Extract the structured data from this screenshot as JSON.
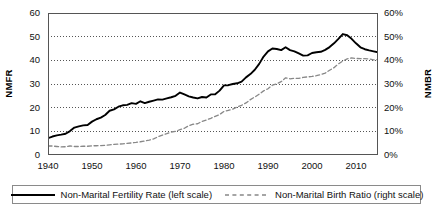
{
  "chart_data": {
    "type": "line",
    "title": "",
    "xlabel": "",
    "ylabel": "NMFR",
    "y2label": "NMBR",
    "xlim": [
      1940,
      2015
    ],
    "ylim": [
      0,
      60
    ],
    "y2lim": [
      0,
      60
    ],
    "grid": true,
    "legend_position": "bottom",
    "x_ticks": [
      "1940",
      "1950",
      "1960",
      "1970",
      "1980",
      "1990",
      "2000",
      "2010"
    ],
    "y_ticks_left": [
      "0",
      "10",
      "20",
      "30",
      "40",
      "50",
      "60"
    ],
    "y_ticks_right": [
      "0%",
      "10%",
      "20%",
      "30%",
      "40%",
      "50%",
      "60%"
    ],
    "series": [
      {
        "name": "Non-Marital Fertility Rate (left scale)",
        "axis": "left",
        "style": "solid",
        "color": "#000000",
        "x": [
          1940,
          1941,
          1942,
          1943,
          1944,
          1945,
          1946,
          1947,
          1948,
          1949,
          1950,
          1951,
          1952,
          1953,
          1954,
          1955,
          1956,
          1957,
          1958,
          1959,
          1960,
          1961,
          1962,
          1963,
          1964,
          1965,
          1966,
          1967,
          1968,
          1969,
          1970,
          1971,
          1972,
          1973,
          1974,
          1975,
          1976,
          1977,
          1978,
          1979,
          1980,
          1981,
          1982,
          1983,
          1984,
          1985,
          1986,
          1987,
          1988,
          1989,
          1990,
          1991,
          1992,
          1993,
          1994,
          1995,
          1996,
          1997,
          1998,
          1999,
          2000,
          2001,
          2002,
          2003,
          2004,
          2005,
          2006,
          2007,
          2008,
          2009,
          2010,
          2011,
          2012,
          2013,
          2014,
          2015
        ],
        "values": [
          7.1,
          7.8,
          8.3,
          8.6,
          9.0,
          10.1,
          11.6,
          12.1,
          12.5,
          12.7,
          14.1,
          15.1,
          15.8,
          16.9,
          18.7,
          19.3,
          20.4,
          21.0,
          21.2,
          21.9,
          21.6,
          22.7,
          21.9,
          22.5,
          23.0,
          23.5,
          23.4,
          23.9,
          24.4,
          25.0,
          26.4,
          25.6,
          24.8,
          24.3,
          23.9,
          24.5,
          24.3,
          25.6,
          25.7,
          27.2,
          29.4,
          29.5,
          30.0,
          30.3,
          31.0,
          32.8,
          34.2,
          36.0,
          38.5,
          41.6,
          43.8,
          45.0,
          44.8,
          44.3,
          45.5,
          44.3,
          43.8,
          42.9,
          42.0,
          42.1,
          43.1,
          43.4,
          43.6,
          44.4,
          45.6,
          47.2,
          49.1,
          51.1,
          50.6,
          49.1,
          47.2,
          45.5,
          44.7,
          44.2,
          43.8,
          43.4
        ]
      },
      {
        "name": "Non-Marital Birth Ratio (right scale)",
        "axis": "right",
        "style": "dashed",
        "color": "#888888",
        "x": [
          1940,
          1941,
          1942,
          1943,
          1944,
          1945,
          1946,
          1947,
          1948,
          1949,
          1950,
          1951,
          1952,
          1953,
          1954,
          1955,
          1956,
          1957,
          1958,
          1959,
          1960,
          1961,
          1962,
          1963,
          1964,
          1965,
          1966,
          1967,
          1968,
          1969,
          1970,
          1971,
          1972,
          1973,
          1974,
          1975,
          1976,
          1977,
          1978,
          1979,
          1980,
          1981,
          1982,
          1983,
          1984,
          1985,
          1986,
          1987,
          1988,
          1989,
          1990,
          1991,
          1992,
          1993,
          1994,
          1995,
          1996,
          1997,
          1998,
          1999,
          2000,
          2001,
          2002,
          2003,
          2004,
          2005,
          2006,
          2007,
          2008,
          2009,
          2010,
          2011,
          2012,
          2013,
          2014,
          2015
        ],
        "values": [
          3.8,
          3.8,
          3.6,
          3.4,
          3.5,
          3.8,
          3.6,
          3.6,
          3.7,
          3.7,
          3.9,
          3.9,
          4.0,
          4.1,
          4.3,
          4.5,
          4.6,
          4.7,
          4.9,
          5.1,
          5.3,
          5.6,
          5.9,
          6.3,
          6.8,
          7.7,
          8.4,
          9.0,
          9.7,
          10.0,
          10.7,
          11.3,
          12.4,
          13.0,
          13.2,
          14.2,
          14.8,
          15.5,
          16.3,
          17.1,
          18.4,
          18.9,
          19.4,
          20.3,
          21.0,
          22.0,
          23.4,
          24.5,
          25.7,
          27.1,
          28.0,
          29.5,
          30.1,
          31.0,
          32.6,
          32.2,
          32.4,
          32.4,
          32.8,
          33.0,
          33.2,
          33.5,
          34.0,
          34.6,
          35.8,
          36.9,
          38.5,
          39.7,
          40.6,
          41.0,
          40.8,
          40.7,
          40.7,
          40.6,
          40.2,
          40.3
        ]
      }
    ]
  },
  "axes": {
    "left_title": "NMFR",
    "right_title": "NMBR"
  },
  "legend": {
    "entries": [
      {
        "label": "Non-Marital Fertility Rate (left scale)",
        "style": "solid",
        "color": "#000000"
      },
      {
        "label": "Non-Marital Birth Ratio (right scale)",
        "style": "dashed",
        "color": "#888888"
      }
    ]
  }
}
